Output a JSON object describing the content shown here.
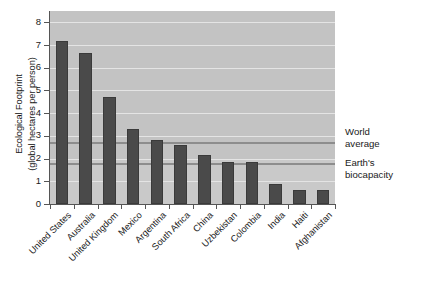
{
  "chart_data": {
    "type": "bar",
    "title": "",
    "xlabel": "",
    "ylabel": "Ecological Footprint (global hectares per person)",
    "ylabel_line1": "Ecological Footprint",
    "ylabel_line2": "(global hectares per person)",
    "ylim": [
      0,
      8.5
    ],
    "yticks": [
      0,
      1,
      2,
      3,
      4,
      5,
      6,
      7,
      8
    ],
    "ytick_labels": [
      "0",
      "1",
      "2",
      "3",
      "4",
      "5",
      "6",
      "7",
      "8"
    ],
    "grid": true,
    "legend": "none",
    "categories": [
      "United States",
      "Australia",
      "United Kingdom",
      "Mexico",
      "Argentina",
      "South Africa",
      "China",
      "Uzbekistan",
      "Colombia",
      "India",
      "Haiti",
      "Afghanistan"
    ],
    "values": [
      7.2,
      6.65,
      4.7,
      3.3,
      2.8,
      2.6,
      2.15,
      1.85,
      1.85,
      0.9,
      0.6,
      0.6
    ],
    "bar_color": "#4a4a4a",
    "plot_background": "#c9c9c9",
    "reference_lines": [
      {
        "label_line1": "World",
        "label_line2": "average",
        "value": 2.75,
        "color": "#8d8d8d"
      },
      {
        "label_line1": "Earth's",
        "label_line2": "biocapacity",
        "value": 1.8,
        "color": "#8d8d8d"
      }
    ]
  },
  "annotations": {
    "world_average_line1": "World",
    "world_average_line2": "average",
    "biocapacity_line1": "Earth's",
    "biocapacity_line2": "biocapacity"
  },
  "caption": {
    "text": ""
  }
}
